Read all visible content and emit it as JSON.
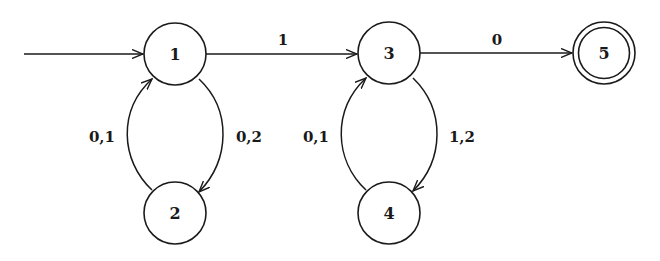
{
  "diagram": {
    "type": "finite-automaton",
    "colors": {
      "stroke": "#1a1a1a",
      "background": "#ffffff"
    },
    "start_state": "1",
    "states": [
      {
        "id": "1",
        "label": "1",
        "cx": 175,
        "cy": 54,
        "accepting": false
      },
      {
        "id": "2",
        "label": "2",
        "cx": 175,
        "cy": 213,
        "accepting": false
      },
      {
        "id": "3",
        "label": "3",
        "cx": 389,
        "cy": 53,
        "accepting": false
      },
      {
        "id": "4",
        "label": "4",
        "cx": 389,
        "cy": 213,
        "accepting": false
      },
      {
        "id": "5",
        "label": "5",
        "cx": 604,
        "cy": 53,
        "accepting": true
      }
    ],
    "transitions": [
      {
        "from": "1",
        "to": "3",
        "label": "1"
      },
      {
        "from": "3",
        "to": "5",
        "label": "0"
      },
      {
        "from": "1",
        "to": "2",
        "label": "0,2"
      },
      {
        "from": "2",
        "to": "1",
        "label": "0,1"
      },
      {
        "from": "3",
        "to": "4",
        "label": "1,2"
      },
      {
        "from": "4",
        "to": "3",
        "label": "0,1"
      }
    ]
  }
}
